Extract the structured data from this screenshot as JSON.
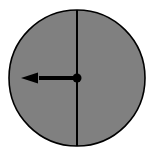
{
  "figure": {
    "canvas": {
      "width": 150,
      "height": 156,
      "background_color": "#ffffff"
    },
    "dial": {
      "label": "clock dial",
      "shape": "circle",
      "center_x": 77,
      "center_y": 78,
      "radius": 68,
      "fill_color": "#808080",
      "stroke_color": "#000000",
      "stroke_width": 1.6
    },
    "hands": [
      {
        "name": "minute-hand",
        "label": "Minute hand",
        "style": "plain line spanning full diameter",
        "direction": "up",
        "angle_degrees": 0,
        "points_to_hour": 12,
        "color": "#000000",
        "thickness": 2,
        "x1": 77,
        "y1": 10,
        "x2": 77,
        "y2": 146
      },
      {
        "name": "hour-hand",
        "label": "Hour hand",
        "style": "arrow with triangular head",
        "direction": "left",
        "angle_degrees": 270,
        "points_to_hour": 9,
        "color": "#000000",
        "shaft_thickness": 4,
        "shaft_x1": 77,
        "shaft_y1": 78,
        "shaft_x2": 38,
        "shaft_y2": 78,
        "tip_x": 21,
        "tip_y": 78,
        "head_length": 17,
        "head_half_width": 5.5
      }
    ],
    "hub": {
      "name": "center-hub",
      "label": "Center pivot",
      "center_x": 77,
      "center_y": 78,
      "radius": 4.5,
      "color": "#000000"
    },
    "reading": {
      "time": "9:00",
      "hour": 9,
      "minute": 0
    }
  }
}
